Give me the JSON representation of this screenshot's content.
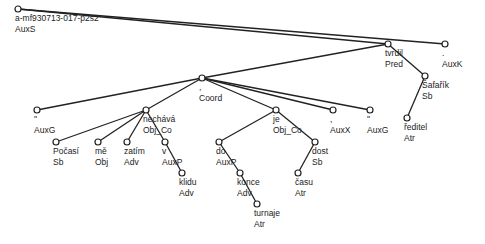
{
  "tree": {
    "root_id": "a-mf930713-017-p2s2",
    "root_afun": "AuxS",
    "nodes": [
      {
        "id": "root",
        "x": 18,
        "y": 9,
        "form": "a-mf930713-017-p2s2",
        "afun": "AuxS",
        "parent": null
      },
      {
        "id": "tvrdil",
        "x": 388,
        "y": 44,
        "form": "tvrdil",
        "afun": "Pred",
        "parent": "root"
      },
      {
        "id": "auxk",
        "x": 445,
        "y": 44,
        "form": ".",
        "afun": "AuxK",
        "parent": "root"
      },
      {
        "id": "safarik",
        "x": 425,
        "y": 76,
        "form": "Šafařík",
        "afun": "Sb",
        "parent": "tvrdil"
      },
      {
        "id": "reditel",
        "x": 407,
        "y": 118,
        "form": "ředitel",
        "afun": "Atr",
        "parent": "safarik"
      },
      {
        "id": "coord",
        "x": 202,
        "y": 78,
        "form": ",",
        "afun": "Coord",
        "parent": "tvrdil"
      },
      {
        "id": "auxg1",
        "x": 37,
        "y": 110,
        "form": "\"",
        "afun": "AuxG",
        "parent": "coord"
      },
      {
        "id": "nechava",
        "x": 146,
        "y": 110,
        "form": "nechává",
        "afun": "Obj_Co",
        "parent": "coord"
      },
      {
        "id": "pocasi",
        "x": 56,
        "y": 142,
        "form": "Počasí",
        "afun": "Sb",
        "parent": "nechava"
      },
      {
        "id": "me",
        "x": 98,
        "y": 142,
        "form": "mě",
        "afun": "Obj",
        "parent": "nechava"
      },
      {
        "id": "zatim",
        "x": 127,
        "y": 142,
        "form": "zatím",
        "afun": "Adv",
        "parent": "nechava"
      },
      {
        "id": "v",
        "x": 165,
        "y": 142,
        "form": "v",
        "afun": "AuxP",
        "parent": "nechava"
      },
      {
        "id": "klidu",
        "x": 182,
        "y": 173,
        "form": "klidu",
        "afun": "Adv",
        "parent": "v"
      },
      {
        "id": "je",
        "x": 276,
        "y": 110,
        "form": "je",
        "afun": "Obj_Co",
        "parent": "coord"
      },
      {
        "id": "do",
        "x": 219,
        "y": 142,
        "form": "do",
        "afun": "AuxP",
        "parent": "je"
      },
      {
        "id": "konce",
        "x": 240,
        "y": 173,
        "form": "konce",
        "afun": "Adv",
        "parent": "do"
      },
      {
        "id": "turnaje",
        "x": 257,
        "y": 204,
        "form": "turnaje",
        "afun": "Atr",
        "parent": "konce"
      },
      {
        "id": "dost",
        "x": 315,
        "y": 142,
        "form": "dost",
        "afun": "Sb",
        "parent": "je"
      },
      {
        "id": "casu",
        "x": 298,
        "y": 173,
        "form": "času",
        "afun": "Atr",
        "parent": "dost"
      },
      {
        "id": "auxx",
        "x": 333,
        "y": 110,
        "form": ",",
        "afun": "AuxX",
        "parent": "coord"
      },
      {
        "id": "auxg2",
        "x": 370,
        "y": 110,
        "form": "\"",
        "afun": "AuxG",
        "parent": "coord"
      }
    ]
  }
}
